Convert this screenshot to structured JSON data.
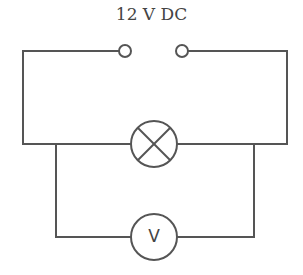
{
  "diagram": {
    "type": "circuit",
    "supply_label": "12 V DC",
    "components": [
      {
        "id": "supply",
        "kind": "dc-supply-terminals",
        "label": "12 V DC"
      },
      {
        "id": "lamp",
        "kind": "lamp",
        "label": ""
      },
      {
        "id": "voltmeter",
        "kind": "voltmeter",
        "label": "V"
      }
    ],
    "connections": [
      "supply in series with lamp",
      "voltmeter in parallel with lamp"
    ],
    "voltmeter_symbol": "V",
    "colors": {
      "wire": "#555555",
      "text": "#444444",
      "background": "#ffffff"
    }
  }
}
